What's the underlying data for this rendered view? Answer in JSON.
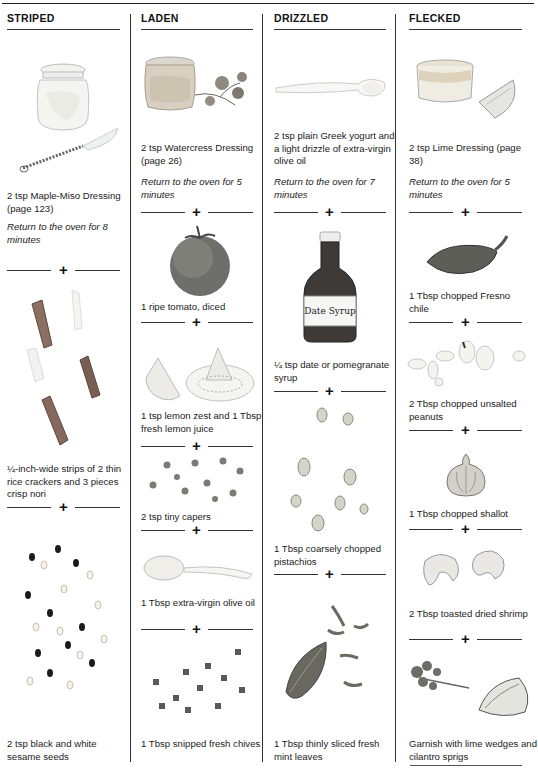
{
  "columns": [
    {
      "heading": "STRIPED",
      "steps": [
        {
          "text": "2 tsp Maple-Miso Dressing (page 123)",
          "note": "Return to the oven for 8 minutes",
          "illustration": "jar-and-whisk"
        },
        {
          "text": "¼-inch-wide strips of 2 thin rice crackers and 3 pieces crisp nori",
          "illustration": "nori-strips"
        },
        {
          "text": "2 tsp black and white sesame seeds",
          "illustration": "sesame-seeds"
        }
      ]
    },
    {
      "heading": "LADEN",
      "steps": [
        {
          "text": "2 tsp Watercress Dressing (page 26)",
          "note": "Return to the oven for 5 minutes",
          "illustration": "jar-and-watercress"
        },
        {
          "text": "1 ripe tomato, diced",
          "illustration": "tomato"
        },
        {
          "text": "1 tsp lemon zest and 1 Tbsp fresh lemon juice",
          "illustration": "lemon-and-juicer"
        },
        {
          "text": "2 tsp tiny capers",
          "illustration": "capers"
        },
        {
          "text": "1 Tbsp extra-virgin olive oil",
          "illustration": "spoon"
        },
        {
          "text": "1 Tbsp snipped fresh chives",
          "illustration": "chives"
        }
      ]
    },
    {
      "heading": "DRIZZLED",
      "steps": [
        {
          "text": "2 tsp plain Greek yogurt and a light drizzle of extra-virgin olive oil",
          "note": "Return to the oven for 7 minutes",
          "illustration": "spoon"
        },
        {
          "text": "¼ tsp date or pomegranate syrup",
          "illustration": "date-syrup-bottle",
          "label": "Date Syrup"
        },
        {
          "text": "1 Tbsp coarsely chopped pistachios",
          "illustration": "pistachios"
        },
        {
          "text": "1 Tbsp thinly sliced fresh mint leaves",
          "illustration": "mint-leaves"
        }
      ]
    },
    {
      "heading": "FLECKED",
      "steps": [
        {
          "text": "2 tsp Lime Dressing (page 38)",
          "note": "Return to the oven for 5 minutes",
          "illustration": "ramekin-and-lime"
        },
        {
          "text": "1 Tbsp chopped Fresno chile",
          "illustration": "chile"
        },
        {
          "text": "2 Tbsp chopped unsalted peanuts",
          "illustration": "peanuts"
        },
        {
          "text": "1 Tbsp chopped shallot",
          "illustration": "shallot"
        },
        {
          "text": "2 Tbsp toasted dried shrimp",
          "illustration": "dried-shrimp"
        },
        {
          "text": "Garnish with lime wedges and cilantro sprigs",
          "illustration": "cilantro-and-lime"
        }
      ]
    }
  ],
  "divider_symbol": "+"
}
